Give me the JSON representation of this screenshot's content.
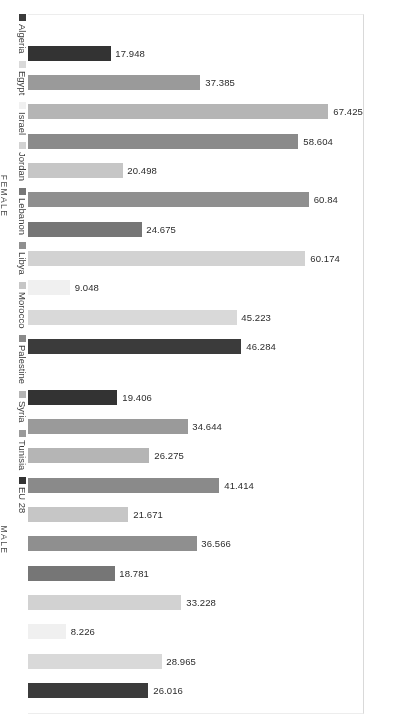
{
  "legend": {
    "position": "right",
    "items": [
      {
        "label": "Algeria",
        "color": "#3b3b3b"
      },
      {
        "label": "Egypt",
        "color": "#d9d9d9"
      },
      {
        "label": "Israel",
        "color": "#f0f0f0"
      },
      {
        "label": "Jordan",
        "color": "#d2d2d2"
      },
      {
        "label": "Lebanon",
        "color": "#767676"
      },
      {
        "label": "Libya",
        "color": "#8f8f8f"
      },
      {
        "label": "Morocco",
        "color": "#c6c6c6"
      },
      {
        "label": "Palestine",
        "color": "#8a8a8a"
      },
      {
        "label": "Syria",
        "color": "#b5b5b5"
      },
      {
        "label": "Tunisia",
        "color": "#9a9a9a"
      },
      {
        "label": "EU 28",
        "color": "#333333"
      }
    ]
  },
  "axis": {
    "group_labels": {
      "male": "MALE",
      "female": "FEMALE"
    }
  },
  "chart_data": {
    "type": "bar",
    "orientation": "horizontal",
    "title": "",
    "subtitle": "",
    "xlabel": "",
    "ylabel": "",
    "grid": false,
    "legend_position": "right",
    "categories": [
      "FEMALE",
      "MALE"
    ],
    "series": [
      {
        "name": "Algeria",
        "color": "#3b3b3b",
        "values": {
          "FEMALE": 46.284,
          "MALE": 26.016
        }
      },
      {
        "name": "Egypt",
        "color": "#d9d9d9",
        "values": {
          "FEMALE": 45.223,
          "MALE": 28.965
        }
      },
      {
        "name": "Israel",
        "color": "#f0f0f0",
        "values": {
          "FEMALE": 9.048,
          "MALE": 8.226
        }
      },
      {
        "name": "Jordan",
        "color": "#d2d2d2",
        "values": {
          "FEMALE": 60.174,
          "MALE": 33.228
        }
      },
      {
        "name": "Lebanon",
        "color": "#767676",
        "values": {
          "FEMALE": 24.675,
          "MALE": 18.781
        }
      },
      {
        "name": "Libya",
        "color": "#8f8f8f",
        "values": {
          "FEMALE": 60.84,
          "MALE": 36.566
        }
      },
      {
        "name": "Morocco",
        "color": "#c6c6c6",
        "values": {
          "FEMALE": 20.498,
          "MALE": 21.671
        }
      },
      {
        "name": "Palestine",
        "color": "#8a8a8a",
        "values": {
          "FEMALE": 58.604,
          "MALE": 41.414
        }
      },
      {
        "name": "Syria",
        "color": "#b5b5b5",
        "values": {
          "FEMALE": 67.425,
          "MALE": 26.275
        }
      },
      {
        "name": "Tunisia",
        "color": "#9a9a9a",
        "values": {
          "FEMALE": 37.385,
          "MALE": 34.644
        }
      },
      {
        "name": "EU 28",
        "color": "#333333",
        "values": {
          "FEMALE": 17.948,
          "MALE": 19.406
        }
      }
    ],
    "xlim": [
      0,
      72
    ],
    "value_label_format": "0.000"
  },
  "bars": {
    "male": [
      {
        "name": "Algeria",
        "value": 26.016,
        "label": "26.016",
        "color": "#3b3b3b"
      },
      {
        "name": "Egypt",
        "value": 28.965,
        "label": "28.965",
        "color": "#d9d9d9"
      },
      {
        "name": "Israel",
        "value": 8.226,
        "label": "8.226",
        "color": "#f0f0f0"
      },
      {
        "name": "Jordan",
        "value": 33.228,
        "label": "33.228",
        "color": "#d2d2d2"
      },
      {
        "name": "Lebanon",
        "value": 18.781,
        "label": "18.781",
        "color": "#767676"
      },
      {
        "name": "Libya",
        "value": 36.566,
        "label": "36.566",
        "color": "#8f8f8f"
      },
      {
        "name": "Morocco",
        "value": 21.671,
        "label": "21.671",
        "color": "#c6c6c6"
      },
      {
        "name": "Palestine",
        "value": 41.414,
        "label": "41.414",
        "color": "#8a8a8a"
      },
      {
        "name": "Syria",
        "value": 26.275,
        "label": "26.275",
        "color": "#b5b5b5"
      },
      {
        "name": "Tunisia",
        "value": 34.644,
        "label": "34.644",
        "color": "#9a9a9a"
      },
      {
        "name": "EU 28",
        "value": 19.406,
        "label": "19.406",
        "color": "#333333"
      }
    ],
    "female": [
      {
        "name": "Algeria",
        "value": 46.284,
        "label": "46.284",
        "color": "#3b3b3b"
      },
      {
        "name": "Egypt",
        "value": 45.223,
        "label": "45.223",
        "color": "#d9d9d9"
      },
      {
        "name": "Israel",
        "value": 9.048,
        "label": "9.048",
        "color": "#f0f0f0"
      },
      {
        "name": "Jordan",
        "value": 60.174,
        "label": "60.174",
        "color": "#d2d2d2"
      },
      {
        "name": "Lebanon",
        "value": 24.675,
        "label": "24.675",
        "color": "#767676"
      },
      {
        "name": "Libya",
        "value": 60.84,
        "label": "60.84",
        "color": "#8f8f8f"
      },
      {
        "name": "Morocco",
        "value": 20.498,
        "label": "20.498",
        "color": "#c6c6c6"
      },
      {
        "name": "Palestine",
        "value": 58.604,
        "label": "58.604",
        "color": "#8a8a8a"
      },
      {
        "name": "Syria",
        "value": 67.425,
        "label": "67.425",
        "color": "#b5b5b5"
      },
      {
        "name": "Tunisia",
        "value": 37.385,
        "label": "37.385",
        "color": "#9a9a9a"
      },
      {
        "name": "EU 28",
        "value": 17.948,
        "label": "17.948",
        "color": "#333333"
      }
    ]
  }
}
